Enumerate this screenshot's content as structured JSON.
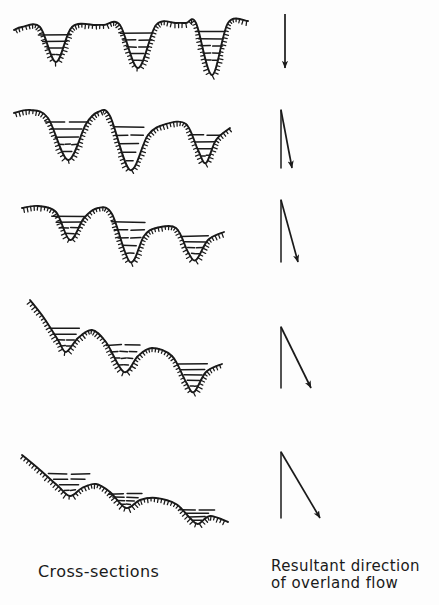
{
  "figure": {
    "title_left": "Cross-sections",
    "title_right_line1": "Resultant direction",
    "title_right_line2": "of overland flow",
    "background_color": "#fdfdfd",
    "ink_color": "#1a1a1a"
  },
  "chart_data": {
    "type": "line",
    "xlabel": "Cross-sections",
    "ylabel": "",
    "grid": false,
    "legend_position": "none",
    "series": [
      {
        "name": "stage-1",
        "label": "Stage 1 - deeply dissected, sharp V-valleys, flat interfluves",
        "relief": "maximum",
        "valleys": 3,
        "profile": [
          [
            14,
            30
          ],
          [
            22,
            27
          ],
          [
            40,
            27
          ],
          [
            56,
            62
          ],
          [
            72,
            27
          ],
          [
            96,
            25
          ],
          [
            104,
            25
          ],
          [
            120,
            25
          ],
          [
            138,
            68
          ],
          [
            156,
            25
          ],
          [
            176,
            23
          ],
          [
            186,
            23
          ],
          [
            196,
            23
          ],
          [
            212,
            75
          ],
          [
            228,
            23
          ],
          [
            248,
            21
          ]
        ],
        "hachure_side": "below",
        "valley_fills": [
          {
            "x_left": 16,
            "x_right": 70,
            "apex_x": 56,
            "top_y": 28,
            "apex_y": 62,
            "dashes": 4
          },
          {
            "x_left": 100,
            "x_right": 152,
            "apex_x": 138,
            "top_y": 26,
            "apex_y": 68,
            "dashes": 5
          },
          {
            "x_left": 180,
            "x_right": 226,
            "apex_x": 212,
            "top_y": 24,
            "apex_y": 75,
            "dashes": 6
          }
        ]
      },
      {
        "name": "stage-2",
        "label": "Stage 2 - rounded summits, slight overall slope",
        "relief": "high",
        "valleys": 3,
        "profile": [
          [
            14,
            113
          ],
          [
            30,
            110
          ],
          [
            48,
            118
          ],
          [
            68,
            160
          ],
          [
            86,
            124
          ],
          [
            98,
            112
          ],
          [
            110,
            116
          ],
          [
            130,
            170
          ],
          [
            148,
            135
          ],
          [
            166,
            124
          ],
          [
            186,
            124
          ],
          [
            198,
            150
          ],
          [
            206,
            163
          ],
          [
            216,
            140
          ],
          [
            230,
            128
          ]
        ],
        "hachure_side": "below",
        "valley_fills": [
          {
            "x_left": 18,
            "x_right": 80,
            "apex_x": 68,
            "top_y": 114,
            "apex_y": 160,
            "dashes": 5
          },
          {
            "x_left": 94,
            "x_right": 144,
            "apex_x": 130,
            "top_y": 118,
            "apex_y": 170,
            "dashes": 5
          },
          {
            "x_left": 170,
            "x_right": 216,
            "apex_x": 206,
            "top_y": 128,
            "apex_y": 163,
            "dashes": 4
          }
        ]
      },
      {
        "name": "stage-3",
        "label": "Stage 3 - reduced relief, stepped descent",
        "relief": "moderate",
        "valleys": 3,
        "profile": [
          [
            22,
            208
          ],
          [
            38,
            206
          ],
          [
            56,
            212
          ],
          [
            70,
            240
          ],
          [
            84,
            218
          ],
          [
            98,
            208
          ],
          [
            112,
            214
          ],
          [
            130,
            262
          ],
          [
            144,
            236
          ],
          [
            156,
            228
          ],
          [
            176,
            228
          ],
          [
            188,
            252
          ],
          [
            196,
            260
          ],
          [
            208,
            240
          ],
          [
            224,
            232
          ]
        ],
        "hachure_side": "below",
        "valley_fills": [
          {
            "x_left": 26,
            "x_right": 82,
            "apex_x": 70,
            "top_y": 210,
            "apex_y": 240,
            "dashes": 4
          },
          {
            "x_left": 96,
            "x_right": 150,
            "apex_x": 130,
            "top_y": 214,
            "apex_y": 262,
            "dashes": 5
          },
          {
            "x_left": 164,
            "x_right": 210,
            "apex_x": 196,
            "top_y": 230,
            "apex_y": 260,
            "dashes": 4
          }
        ]
      },
      {
        "name": "stage-4",
        "label": "Stage 4 - subdued relief, broad concave slope",
        "relief": "low",
        "valleys": 3,
        "profile": [
          [
            30,
            300
          ],
          [
            44,
            318
          ],
          [
            58,
            340
          ],
          [
            66,
            352
          ],
          [
            78,
            338
          ],
          [
            92,
            330
          ],
          [
            106,
            342
          ],
          [
            124,
            372
          ],
          [
            138,
            356
          ],
          [
            152,
            348
          ],
          [
            172,
            356
          ],
          [
            186,
            382
          ],
          [
            194,
            392
          ],
          [
            206,
            372
          ],
          [
            222,
            364
          ]
        ],
        "hachure_side": "below",
        "valley_fills": [
          {
            "x_left": 36,
            "x_right": 86,
            "apex_x": 66,
            "top_y": 322,
            "apex_y": 352,
            "dashes": 4
          },
          {
            "x_left": 96,
            "x_right": 146,
            "apex_x": 124,
            "top_y": 338,
            "apex_y": 372,
            "dashes": 4
          },
          {
            "x_left": 160,
            "x_right": 208,
            "apex_x": 194,
            "top_y": 358,
            "apex_y": 392,
            "dashes": 5
          }
        ]
      },
      {
        "name": "stage-5",
        "label": "Stage 5 - peneplain, gentle uniform slope",
        "relief": "minimal",
        "valleys": 3,
        "profile": [
          [
            22,
            455
          ],
          [
            40,
            470
          ],
          [
            58,
            486
          ],
          [
            70,
            496
          ],
          [
            82,
            488
          ],
          [
            96,
            484
          ],
          [
            110,
            492
          ],
          [
            126,
            508
          ],
          [
            140,
            500
          ],
          [
            156,
            498
          ],
          [
            176,
            504
          ],
          [
            190,
            518
          ],
          [
            198,
            524
          ],
          [
            210,
            516
          ],
          [
            228,
            522
          ]
        ],
        "hachure_side": "below",
        "valley_fills": [
          {
            "x_left": 28,
            "x_right": 90,
            "apex_x": 70,
            "top_y": 468,
            "apex_y": 496,
            "dashes": 4
          },
          {
            "x_left": 100,
            "x_right": 150,
            "apex_x": 126,
            "top_y": 490,
            "apex_y": 508,
            "dashes": 4
          },
          {
            "x_left": 160,
            "x_right": 212,
            "apex_x": 198,
            "top_y": 506,
            "apex_y": 524,
            "dashes": 4
          }
        ]
      }
    ],
    "arrows": [
      {
        "name": "arrow-1",
        "stage": 1,
        "x1": 285,
        "y1": 14,
        "x2": 285,
        "y2": 68,
        "tilt_degrees": 0,
        "has_reference_line": false
      },
      {
        "name": "arrow-2",
        "stage": 2,
        "x1": 281,
        "y1": 110,
        "x2": 292,
        "y2": 168,
        "tilt_degrees": 11,
        "has_reference_line": true
      },
      {
        "name": "arrow-3",
        "stage": 3,
        "x1": 281,
        "y1": 200,
        "x2": 298,
        "y2": 262,
        "tilt_degrees": 15,
        "has_reference_line": true
      },
      {
        "name": "arrow-4",
        "stage": 4,
        "x1": 281,
        "y1": 327,
        "x2": 311,
        "y2": 388,
        "tilt_degrees": 26,
        "has_reference_line": true
      },
      {
        "name": "arrow-5",
        "stage": 5,
        "x1": 281,
        "y1": 452,
        "x2": 320,
        "y2": 518,
        "tilt_degrees": 31,
        "has_reference_line": true
      }
    ]
  }
}
